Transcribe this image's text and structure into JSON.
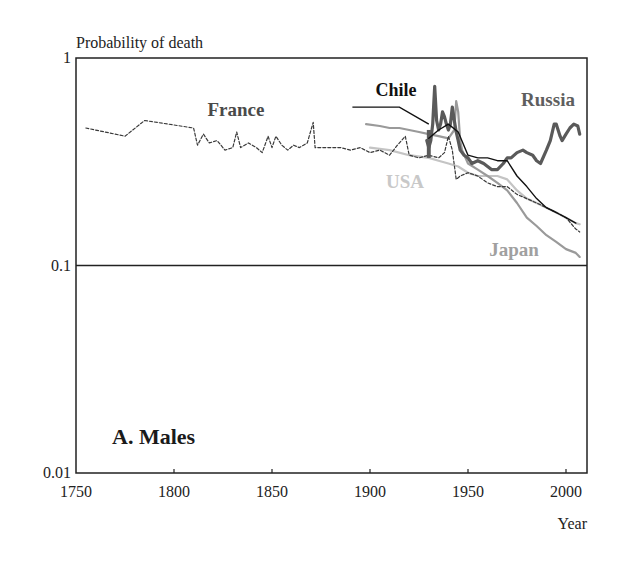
{
  "chart_data": {
    "type": "line",
    "title": "",
    "panel_label": "A. Males",
    "ylabel": "Probability of death",
    "xlabel": "Year",
    "yscale": "log",
    "ylim": [
      0.01,
      1
    ],
    "xlim": [
      1750,
      2010
    ],
    "yticks": [
      {
        "value": 1,
        "label": "1"
      },
      {
        "value": 0.1,
        "label": "0.1"
      },
      {
        "value": 0.01,
        "label": "0.01"
      }
    ],
    "xticks": [
      {
        "value": 1750,
        "label": "1750"
      },
      {
        "value": 1800,
        "label": "1800"
      },
      {
        "value": 1850,
        "label": "1850"
      },
      {
        "value": 1900,
        "label": "1900"
      },
      {
        "value": 1950,
        "label": "1950"
      },
      {
        "value": 2000,
        "label": "2000"
      }
    ],
    "reference_lines": [
      {
        "axis": "y",
        "value": 0.1
      }
    ],
    "grid": false,
    "legend": "inline labels",
    "series": [
      {
        "name": "France",
        "color": "#3a3a3a",
        "style": "dashed",
        "width": 1.2,
        "label_pos": {
          "x": 236,
          "y": 116
        },
        "label_color": "#4a4a4a",
        "points": [
          [
            1755,
            0.46
          ],
          [
            1775,
            0.42
          ],
          [
            1785,
            0.5
          ],
          [
            1810,
            0.46
          ],
          [
            1812,
            0.38
          ],
          [
            1815,
            0.43
          ],
          [
            1818,
            0.39
          ],
          [
            1822,
            0.4
          ],
          [
            1826,
            0.36
          ],
          [
            1830,
            0.37
          ],
          [
            1832,
            0.44
          ],
          [
            1834,
            0.37
          ],
          [
            1838,
            0.39
          ],
          [
            1842,
            0.37
          ],
          [
            1845,
            0.35
          ],
          [
            1848,
            0.42
          ],
          [
            1850,
            0.37
          ],
          [
            1852,
            0.42
          ],
          [
            1855,
            0.38
          ],
          [
            1858,
            0.36
          ],
          [
            1861,
            0.38
          ],
          [
            1864,
            0.37
          ],
          [
            1868,
            0.39
          ],
          [
            1871,
            0.49
          ],
          [
            1872,
            0.37
          ],
          [
            1876,
            0.37
          ],
          [
            1880,
            0.37
          ],
          [
            1885,
            0.37
          ],
          [
            1890,
            0.36
          ],
          [
            1895,
            0.37
          ],
          [
            1900,
            0.35
          ],
          [
            1905,
            0.36
          ],
          [
            1910,
            0.34
          ],
          [
            1914,
            0.38
          ],
          [
            1918,
            0.42
          ],
          [
            1920,
            0.34
          ],
          [
            1925,
            0.33
          ],
          [
            1930,
            0.34
          ],
          [
            1935,
            0.33
          ],
          [
            1938,
            0.35
          ],
          [
            1940,
            0.42
          ],
          [
            1942,
            0.36
          ],
          [
            1944,
            0.26
          ],
          [
            1946,
            0.27
          ],
          [
            1950,
            0.28
          ],
          [
            1955,
            0.27
          ],
          [
            1960,
            0.25
          ],
          [
            1965,
            0.24
          ],
          [
            1970,
            0.24
          ],
          [
            1975,
            0.22
          ],
          [
            1980,
            0.21
          ],
          [
            1985,
            0.2
          ],
          [
            1990,
            0.19
          ],
          [
            1995,
            0.18
          ],
          [
            2000,
            0.17
          ],
          [
            2005,
            0.15
          ],
          [
            2007,
            0.145
          ]
        ]
      },
      {
        "name": "USA",
        "color": "#c4c4c4",
        "style": "solid",
        "width": 2.2,
        "label_pos": {
          "x": 405,
          "y": 188
        },
        "label_color": "#c8c8c8",
        "points": [
          [
            1900,
            0.37
          ],
          [
            1910,
            0.36
          ],
          [
            1920,
            0.34
          ],
          [
            1930,
            0.33
          ],
          [
            1935,
            0.32
          ],
          [
            1940,
            0.31
          ],
          [
            1945,
            0.3
          ],
          [
            1950,
            0.28
          ],
          [
            1955,
            0.27
          ],
          [
            1960,
            0.27
          ],
          [
            1965,
            0.27
          ],
          [
            1970,
            0.26
          ],
          [
            1975,
            0.23
          ],
          [
            1980,
            0.21
          ],
          [
            1985,
            0.2
          ],
          [
            1990,
            0.19
          ],
          [
            1995,
            0.18
          ],
          [
            2000,
            0.17
          ],
          [
            2005,
            0.16
          ],
          [
            2007,
            0.158
          ]
        ]
      },
      {
        "name": "Chile",
        "color": "#111111",
        "style": "solid",
        "width": 1.4,
        "label_pos": {
          "x": 396,
          "y": 96
        },
        "label_color": "#111111",
        "points": [
          [
            1930,
            0.41
          ],
          [
            1935,
            0.45
          ],
          [
            1940,
            0.48
          ],
          [
            1945,
            0.44
          ],
          [
            1950,
            0.34
          ],
          [
            1955,
            0.33
          ],
          [
            1960,
            0.33
          ],
          [
            1965,
            0.32
          ],
          [
            1970,
            0.32
          ],
          [
            1975,
            0.27
          ],
          [
            1980,
            0.24
          ],
          [
            1985,
            0.21
          ],
          [
            1990,
            0.19
          ],
          [
            1995,
            0.18
          ],
          [
            2000,
            0.17
          ],
          [
            2005,
            0.16
          ]
        ],
        "leader_line": [
          [
            1891,
            0.58
          ],
          [
            1915,
            0.58
          ],
          [
            1930,
            0.48
          ]
        ]
      },
      {
        "name": "Russia",
        "color": "#5a5a5a",
        "style": "solid",
        "width": 3.2,
        "label_pos": {
          "x": 548,
          "y": 106
        },
        "label_color": "#5e5e5e",
        "points": [
          [
            1929,
            0.4
          ],
          [
            1930,
            0.37
          ],
          [
            1931,
            0.4
          ],
          [
            1932,
            0.48
          ],
          [
            1933,
            0.73
          ],
          [
            1934,
            0.5
          ],
          [
            1935,
            0.45
          ],
          [
            1936,
            0.48
          ],
          [
            1937,
            0.55
          ],
          [
            1938,
            0.52
          ],
          [
            1939,
            0.48
          ],
          [
            1940,
            0.45
          ],
          [
            1941,
            0.48
          ],
          [
            1942,
            0.58
          ],
          [
            1943,
            0.5
          ],
          [
            1944,
            0.44
          ],
          [
            1945,
            0.4
          ],
          [
            1946,
            0.36
          ],
          [
            1948,
            0.34
          ],
          [
            1950,
            0.33
          ],
          [
            1952,
            0.31
          ],
          [
            1955,
            0.32
          ],
          [
            1958,
            0.31
          ],
          [
            1960,
            0.3
          ],
          [
            1962,
            0.29
          ],
          [
            1965,
            0.29
          ],
          [
            1968,
            0.31
          ],
          [
            1970,
            0.33
          ],
          [
            1972,
            0.33
          ],
          [
            1975,
            0.35
          ],
          [
            1978,
            0.36
          ],
          [
            1980,
            0.35
          ],
          [
            1983,
            0.34
          ],
          [
            1985,
            0.32
          ],
          [
            1987,
            0.31
          ],
          [
            1990,
            0.36
          ],
          [
            1992,
            0.4
          ],
          [
            1994,
            0.48
          ],
          [
            1995,
            0.48
          ],
          [
            1997,
            0.42
          ],
          [
            1998,
            0.4
          ],
          [
            2000,
            0.43
          ],
          [
            2002,
            0.46
          ],
          [
            2004,
            0.48
          ],
          [
            2006,
            0.47
          ],
          [
            2007,
            0.43
          ]
        ],
        "block": {
          "from": 1929,
          "to": 1931,
          "low": 0.33,
          "high": 0.45
        }
      },
      {
        "name": "Japan",
        "color": "#9a9a9a",
        "style": "solid",
        "width": 2.2,
        "label_pos": {
          "x": 514,
          "y": 256
        },
        "label_color": "#a0a0a0",
        "points": [
          [
            1898,
            0.48
          ],
          [
            1905,
            0.47
          ],
          [
            1910,
            0.46
          ],
          [
            1915,
            0.46
          ],
          [
            1920,
            0.45
          ],
          [
            1925,
            0.44
          ],
          [
            1930,
            0.43
          ],
          [
            1935,
            0.42
          ],
          [
            1940,
            0.41
          ],
          [
            1943,
            0.45
          ],
          [
            1944,
            0.62
          ],
          [
            1945,
            0.55
          ],
          [
            1946,
            0.4
          ],
          [
            1947,
            0.36
          ],
          [
            1950,
            0.31
          ],
          [
            1955,
            0.29
          ],
          [
            1960,
            0.27
          ],
          [
            1965,
            0.25
          ],
          [
            1970,
            0.23
          ],
          [
            1975,
            0.2
          ],
          [
            1980,
            0.17
          ],
          [
            1985,
            0.155
          ],
          [
            1990,
            0.14
          ],
          [
            1995,
            0.13
          ],
          [
            2000,
            0.12
          ],
          [
            2005,
            0.115
          ],
          [
            2007,
            0.11
          ]
        ]
      }
    ]
  },
  "labels": {
    "ylabel": "Probability of death",
    "xlabel": "Year",
    "panel": "A. Males",
    "france": "France",
    "usa": "USA",
    "chile": "Chile",
    "russia": "Russia",
    "japan": "Japan"
  }
}
